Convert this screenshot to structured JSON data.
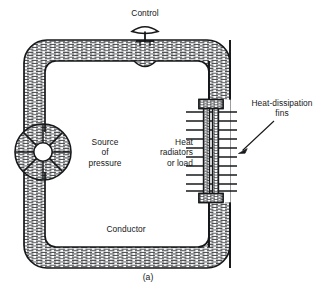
{
  "figure": {
    "caption": "(a)",
    "type": "hydraulic-analogy-diagram",
    "stroke_color": "#16181a",
    "hatch_color": "#3d4043",
    "background_color": "#ffffff"
  },
  "labels": {
    "control": "Control",
    "source_of_pressure": "Source\nof\npressure",
    "heat_radiators": "Heat\nradiators\nor load",
    "heat_dissipation_fins": "Heat-dissipation\nfins",
    "conductor": "Conductor"
  },
  "components": {
    "control_valve": {
      "name": "control-valve",
      "position_x": 145,
      "position_y": 40
    },
    "pressure_source": {
      "name": "pressure-source-pump",
      "center_x": 43,
      "center_y": 152,
      "radius": 28,
      "hub_radius": 9,
      "spoke_count": 8
    },
    "radiator": {
      "name": "heat-radiator-tube",
      "center_x": 211,
      "top_y": 104,
      "bottom_y": 198,
      "fin_count": 10,
      "fin_left_x": 186,
      "fin_right_x": 237
    },
    "loop": {
      "name": "conductor-pipe-loop",
      "outer_left": 24,
      "outer_top": 40,
      "outer_right": 230,
      "outer_bottom": 268,
      "wall_thickness": 21,
      "corner_radius": 22
    },
    "annotation_arrow": {
      "name": "fins-pointer-arrow",
      "from_x": 275,
      "from_y": 122,
      "to_x": 239,
      "to_y": 152
    }
  }
}
